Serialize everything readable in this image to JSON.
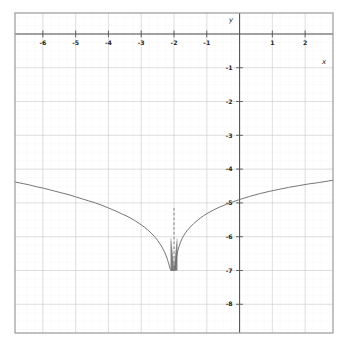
{
  "chart_data": {
    "type": "line",
    "title": "",
    "subtitle": "",
    "xlabel": "x",
    "ylabel": "y",
    "xlim": [
      -6.85,
      2.85
    ],
    "ylim": [
      -8.85,
      0.62
    ],
    "xticks": [
      -6,
      -5,
      -4,
      -3,
      -2,
      -1,
      1,
      2
    ],
    "xticklabels": [
      "-6",
      "-5",
      "-4",
      "-3",
      "-2",
      "-1",
      "1",
      "2"
    ],
    "yticks": [
      -1,
      -2,
      -3,
      -4,
      -5,
      -6,
      -7,
      -8
    ],
    "yticklabels": [
      "-1",
      "-2",
      "-3",
      "-4",
      "-5",
      "-6",
      "-7",
      "-8"
    ],
    "grid": "major-and-minor",
    "grid_major_color": "#c8c8c8",
    "grid_minor_color": "#dcdcdc",
    "axis_color": "#555555",
    "frame_color": "#9a9a9a",
    "legend": "none",
    "curve_color": "#6f6f6f",
    "asymptote": {
      "type": "vertical",
      "x": -2,
      "style": "dashed",
      "color": "#6f6f6f"
    },
    "series": [
      {
        "name": "curve",
        "x": [
          -6.85,
          -6.6,
          -6.4,
          -6.2,
          -6.0,
          -5.8,
          -5.6,
          -5.4,
          -5.2,
          -5.0,
          -4.8,
          -4.6,
          -4.4,
          -4.2,
          -4.0,
          -3.8,
          -3.6,
          -3.4,
          -3.2,
          -3.0,
          -2.9,
          -2.8,
          -2.7,
          -2.6,
          -2.5,
          -2.4,
          -2.3,
          -2.25,
          -2.2,
          -2.15,
          -2.12,
          -2.09,
          -2.07,
          -2.05,
          -2.04,
          -2.03,
          -2.025,
          -2.02,
          -2.016
        ],
        "y": [
          -4.38,
          -4.43,
          -4.47,
          -4.52,
          -4.56,
          -4.61,
          -4.66,
          -4.71,
          -4.76,
          -4.82,
          -4.88,
          -4.94,
          -5.0,
          -5.07,
          -5.15,
          -5.23,
          -5.32,
          -5.41,
          -5.52,
          -5.65,
          -5.72,
          -5.8,
          -5.89,
          -5.99,
          -6.11,
          -6.25,
          -6.43,
          -6.54,
          -6.67,
          -6.84,
          -6.95,
          -7.0,
          -7.0,
          -7.0,
          -7.0,
          -7.0,
          -7.0,
          -7.0,
          -7.0
        ]
      },
      {
        "name": "curve-right-branch",
        "x": [
          -1.985,
          -1.98,
          -1.975,
          -1.97,
          -1.96,
          -1.95,
          -1.93,
          -1.91,
          -1.88,
          -1.85,
          -1.8,
          -1.75,
          -1.7,
          -1.6,
          -1.5,
          -1.4,
          -1.3,
          -1.2,
          -1.1,
          -1.0,
          -0.8,
          -0.6,
          -0.4,
          -0.2,
          0.0,
          0.3,
          0.6,
          0.9,
          1.2,
          1.5,
          1.8,
          2.1,
          2.4,
          2.85
        ],
        "y": [
          -7.0,
          -7.0,
          -7.0,
          -7.0,
          -6.95,
          -6.84,
          -6.67,
          -6.54,
          -6.4,
          -6.3,
          -6.16,
          -6.05,
          -5.96,
          -5.82,
          -5.71,
          -5.61,
          -5.53,
          -5.45,
          -5.38,
          -5.32,
          -5.21,
          -5.12,
          -5.04,
          -4.97,
          -4.9,
          -4.81,
          -4.73,
          -4.66,
          -4.6,
          -4.54,
          -4.49,
          -4.44,
          -4.4,
          -4.33
        ]
      }
    ],
    "notes": {
      "singularity_x": -2,
      "min_value_drawn": -7.0,
      "left_edge_value": -4.38,
      "right_edge_value": -4.33
    }
  },
  "axis_labels": {
    "x_name": "x",
    "y_name": "y"
  }
}
